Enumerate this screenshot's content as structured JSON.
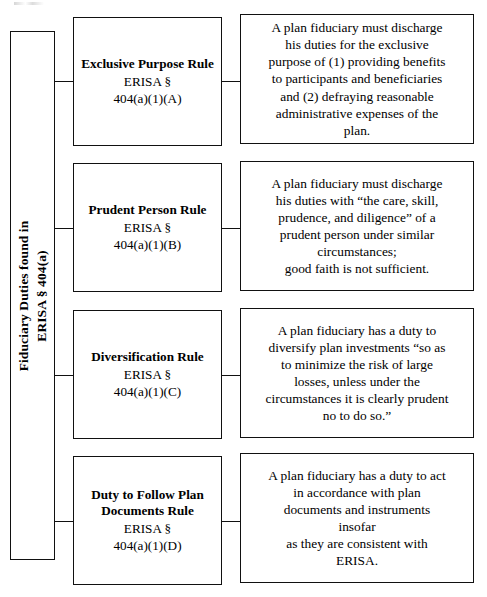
{
  "diagram": {
    "title": "Fiduciary Duties found in ERISA § 404(a)",
    "colors": {
      "background": "#ffffff",
      "text": "#000000",
      "border": "#111111"
    },
    "root": {
      "line1": "Fiduciary Duties found in",
      "line2": "ERISA § 404(a)"
    },
    "rows": [
      {
        "rule_title": "Exclusive Purpose\nRule",
        "rule_title_line1": "Exclusive Purpose",
        "rule_title_line2": "Rule",
        "cite_line1": "ERISA §",
        "cite_line2": "404(a)(1)(A)",
        "description_lines": [
          "A plan fiduciary must discharge",
          "his duties for the exclusive",
          "purpose of (1) providing benefits",
          "to participants and beneficiaries",
          "and (2) defraying reasonable",
          "administrative expenses of the",
          "plan."
        ]
      },
      {
        "rule_title": "Prudent Person\nRule",
        "rule_title_line1": "Prudent Person",
        "rule_title_line2": "Rule",
        "cite_line1": "ERISA §",
        "cite_line2": "404(a)(1)(B)",
        "description_lines": [
          "A plan fiduciary must discharge",
          "his duties with “the care, skill,",
          "prudence, and diligence” of a",
          "prudent person under similar",
          "circumstances;",
          "good faith is not sufficient."
        ]
      },
      {
        "rule_title": "Diversification\nRule",
        "rule_title_line1": "Diversification",
        "rule_title_line2": "Rule",
        "cite_line1": "ERISA §",
        "cite_line2": "404(a)(1)(C)",
        "description_lines": [
          "A plan fiduciary has a duty to",
          "diversify plan investments “so as",
          "to minimize the risk of large",
          "losses, unless under the",
          "circumstances it is clearly prudent",
          "no to do so.”"
        ]
      },
      {
        "rule_title": "Duty to Follow Plan Documents\nRule",
        "rule_title_line1": "Duty to Follow",
        "rule_title_line2": "Plan Documents",
        "rule_title_line3": "Rule",
        "cite_line1": "ERISA §",
        "cite_line2": "404(a)(1)(D)",
        "description_lines": [
          "A plan fiduciary has a duty to act",
          "in accordance with plan",
          "documents and instruments",
          "insofar",
          "as they are consistent with",
          "ERISA."
        ]
      }
    ]
  }
}
